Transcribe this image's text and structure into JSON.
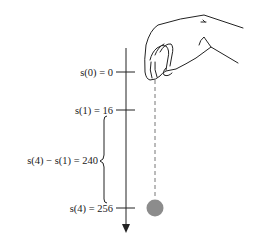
{
  "diagram": {
    "labels": {
      "s0": "s(0) = 0",
      "s1": "s(1) = 16",
      "diff": "s(4) − s(1) = 240",
      "s4": "s(4) = 256"
    },
    "colors": {
      "line": "#222222",
      "ball": "#8c8c8c",
      "dashed": "#777777"
    }
  }
}
